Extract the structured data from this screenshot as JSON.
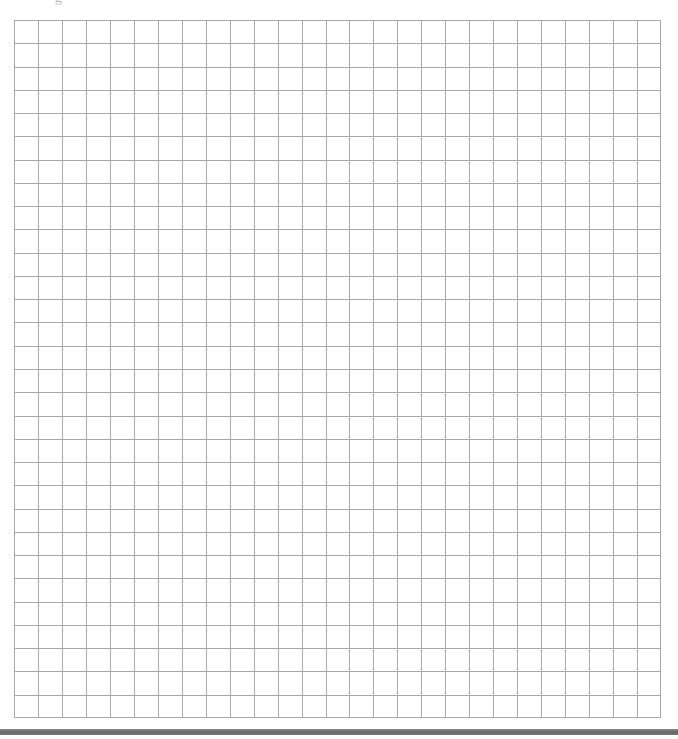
{
  "page": {
    "top_text_fragment": "g"
  },
  "grid": {
    "columns": 27,
    "rows": 30,
    "line_color": "#a8a8a8",
    "background_color": "#ffffff"
  },
  "bottom_bar": {
    "color": "#6e6e6e"
  }
}
